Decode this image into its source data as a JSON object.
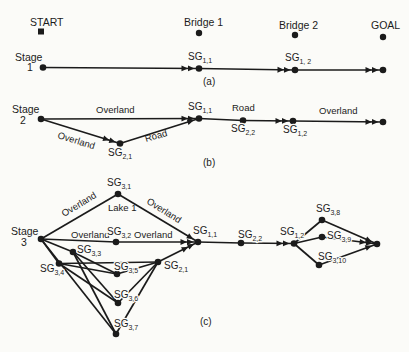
{
  "figure": {
    "width": 409,
    "height": 352,
    "bg": "#fbfbf8",
    "ink": "#1b1b1b",
    "stroke": 1.7,
    "node_r": 3.3,
    "label_size": 10,
    "sub_size": 7,
    "markers": [
      {
        "id": "start",
        "shape": "square",
        "x": 41,
        "y": 31.5,
        "size": 6
      },
      {
        "id": "bridge-1",
        "shape": "dot",
        "x": 199,
        "y": 33,
        "r": 3.2
      },
      {
        "id": "bridge-2",
        "shape": "dot",
        "x": 295,
        "y": 35,
        "r": 3.2
      },
      {
        "id": "goal",
        "shape": "dot",
        "x": 383,
        "y": 37,
        "r": 3.2
      }
    ],
    "nodes": [
      {
        "id": "a-stage1",
        "x": 43,
        "y": 67.5
      },
      {
        "id": "a-sg1-1",
        "x": 199,
        "y": 68.5
      },
      {
        "id": "a-sg1-2",
        "x": 295,
        "y": 70
      },
      {
        "id": "a-end",
        "x": 383,
        "y": 70
      },
      {
        "id": "b-stage2",
        "x": 41,
        "y": 119
      },
      {
        "id": "b-sg2-1",
        "x": 120,
        "y": 143.5
      },
      {
        "id": "b-sg1-1",
        "x": 199,
        "y": 118.5
      },
      {
        "id": "b-sg2-2",
        "x": 243,
        "y": 120.5
      },
      {
        "id": "b-sg1-2",
        "x": 293,
        "y": 121
      },
      {
        "id": "b-end",
        "x": 383,
        "y": 122
      },
      {
        "id": "c-stage3",
        "x": 41,
        "y": 239
      },
      {
        "id": "c-sg3-1",
        "x": 118,
        "y": 194
      },
      {
        "id": "c-sg3-2",
        "x": 116,
        "y": 242
      },
      {
        "id": "c-sg3-3",
        "x": 73,
        "y": 252
      },
      {
        "id": "c-sg3-4",
        "x": 59,
        "y": 263.5
      },
      {
        "id": "c-sg3-5",
        "x": 117,
        "y": 274
      },
      {
        "id": "c-sg3-6",
        "x": 118,
        "y": 303
      },
      {
        "id": "c-sg3-7",
        "x": 116,
        "y": 334
      },
      {
        "id": "c-sg2-1",
        "x": 158,
        "y": 262
      },
      {
        "id": "c-sg1-1",
        "x": 198,
        "y": 242
      },
      {
        "id": "c-sg2-2",
        "x": 241,
        "y": 243
      },
      {
        "id": "c-sg1-2",
        "x": 294,
        "y": 243.5
      },
      {
        "id": "c-sg3-8",
        "x": 322,
        "y": 220
      },
      {
        "id": "c-sg3-9",
        "x": 322,
        "y": 237
      },
      {
        "id": "c-sg3-10",
        "x": 319,
        "y": 265
      },
      {
        "id": "c-end",
        "x": 377,
        "y": 244
      }
    ],
    "edges": [
      {
        "from": "a-stage1",
        "to": "a-sg1-1",
        "arrows": 2
      },
      {
        "from": "a-sg1-1",
        "to": "a-sg1-2",
        "arrows": 2
      },
      {
        "from": "a-sg1-2",
        "to": "a-end",
        "arrows": 2
      },
      {
        "from": "b-stage2",
        "to": "b-sg1-1",
        "arrows": 2
      },
      {
        "from": "b-stage2",
        "to": "b-sg2-1",
        "arrows": 2
      },
      {
        "from": "b-sg2-1",
        "to": "b-sg1-1",
        "arrows": 1
      },
      {
        "from": "b-sg1-1",
        "to": "b-sg2-2",
        "arrows": 0
      },
      {
        "from": "b-sg2-2",
        "to": "b-sg1-2",
        "arrows": 2
      },
      {
        "from": "b-sg1-2",
        "to": "b-end",
        "arrows": 2
      },
      {
        "from": "c-stage3",
        "to": "c-sg3-1",
        "arrows": 0
      },
      {
        "from": "c-sg3-1",
        "to": "c-sg1-1",
        "arrows": 1
      },
      {
        "from": "c-stage3",
        "to": "c-sg3-2",
        "arrows": 0
      },
      {
        "from": "c-sg3-2",
        "to": "c-sg1-1",
        "arrows": 2
      },
      {
        "from": "c-stage3",
        "to": "c-sg3-3",
        "arrows": 0
      },
      {
        "from": "c-stage3",
        "to": "c-sg3-4",
        "arrows": 0
      },
      {
        "from": "c-stage3",
        "to": "c-sg3-7",
        "arrows": 0
      },
      {
        "from": "c-sg3-3",
        "to": "c-sg3-5",
        "arrows": 0
      },
      {
        "from": "c-sg3-3",
        "to": "c-sg3-6",
        "arrows": 0
      },
      {
        "from": "c-sg3-3",
        "to": "c-sg3-7",
        "arrows": 0
      },
      {
        "from": "c-sg3-4",
        "to": "c-sg3-5",
        "arrows": 0
      },
      {
        "from": "c-sg3-4",
        "to": "c-sg3-6",
        "arrows": 0
      },
      {
        "from": "c-sg3-4",
        "to": "c-sg2-1",
        "arrows": 0
      },
      {
        "from": "c-sg3-5",
        "to": "c-sg2-1",
        "arrows": 0
      },
      {
        "from": "c-sg3-6",
        "to": "c-sg2-1",
        "arrows": 0
      },
      {
        "from": "c-sg3-7",
        "to": "c-sg2-1",
        "arrows": 0
      },
      {
        "from": "c-sg2-1",
        "to": "c-sg1-1",
        "arrows": 2
      },
      {
        "from": "c-sg1-1",
        "to": "c-sg2-2",
        "arrows": 0
      },
      {
        "from": "c-sg2-2",
        "to": "c-sg1-2",
        "arrows": 2
      },
      {
        "from": "c-sg1-2",
        "to": "c-sg3-8",
        "arrows": 0
      },
      {
        "from": "c-sg1-2",
        "to": "c-sg3-9",
        "arrows": 0
      },
      {
        "from": "c-sg1-2",
        "to": "c-sg3-10",
        "arrows": 0
      },
      {
        "from": "c-sg3-8",
        "to": "c-end",
        "arrows": 1
      },
      {
        "from": "c-sg3-9",
        "to": "c-end",
        "arrows": 2
      },
      {
        "from": "c-sg3-10",
        "to": "c-end",
        "arrows": 1
      }
    ],
    "labels": [
      {
        "id": "start",
        "text": "START",
        "x": 30,
        "y": 25.5,
        "size": 10.5
      },
      {
        "id": "bridge-1",
        "text": "Bridge 1",
        "x": 184,
        "y": 26,
        "size": 10.5
      },
      {
        "id": "bridge-2",
        "text": "Bridge 2",
        "x": 279,
        "y": 29,
        "size": 10.5
      },
      {
        "id": "goal",
        "text": "GOAL",
        "x": 371,
        "y": 29,
        "size": 10.5
      },
      {
        "id": "a-stage",
        "text": "Stage",
        "x": 15,
        "y": 61,
        "size": 10.5
      },
      {
        "id": "a-stage-num",
        "text": "1",
        "x": 27,
        "y": 71,
        "size": 10.5
      },
      {
        "id": "a-sg1-1",
        "base": "SG",
        "sub": "1,1",
        "x": 188,
        "y": 60
      },
      {
        "id": "a-sg1-2",
        "base": "SG",
        "sub": "1, 2",
        "x": 285,
        "y": 61
      },
      {
        "id": "caption-a",
        "text": "(a)",
        "x": 203,
        "y": 85
      },
      {
        "id": "b-stage",
        "text": "Stage",
        "x": 12,
        "y": 113,
        "size": 10.5
      },
      {
        "id": "b-stage-num",
        "text": "2",
        "x": 20,
        "y": 124,
        "size": 10.5
      },
      {
        "id": "b-overland-top",
        "text": "Overland",
        "x": 96,
        "y": 113,
        "size": 9.5
      },
      {
        "id": "b-overland-diag",
        "text": "Overland",
        "x": 57,
        "y": 138,
        "size": 9.5,
        "rot": 17
      },
      {
        "id": "b-sg2-1",
        "base": "SG",
        "sub": "2,1",
        "x": 108,
        "y": 156
      },
      {
        "id": "b-road-diag",
        "text": "Road",
        "x": 146,
        "y": 142,
        "size": 9.5,
        "rot": -16
      },
      {
        "id": "b-sg1-1",
        "base": "SG",
        "sub": "1,1",
        "x": 188,
        "y": 110
      },
      {
        "id": "b-road-top",
        "text": "Road",
        "x": 232,
        "y": 111,
        "size": 9.5
      },
      {
        "id": "b-sg2-2",
        "base": "SG",
        "sub": "2,2",
        "x": 231,
        "y": 132
      },
      {
        "id": "b-sg1-2",
        "base": "SG",
        "sub": "1,2",
        "x": 283,
        "y": 133
      },
      {
        "id": "b-overland-right",
        "text": "Overland",
        "x": 319,
        "y": 114,
        "size": 9.5
      },
      {
        "id": "caption-b",
        "text": "(b)",
        "x": 203,
        "y": 166
      },
      {
        "id": "c-sg3-1",
        "base": "SG",
        "sub": "3,1",
        "x": 107,
        "y": 186
      },
      {
        "id": "c-lake-1",
        "text": "Lake 1",
        "x": 108,
        "y": 211,
        "size": 9.5
      },
      {
        "id": "c-overland-upleft",
        "text": "Overland",
        "x": 64,
        "y": 217,
        "size": 9.5,
        "rot": -31
      },
      {
        "id": "c-overland-upright",
        "text": "Overland",
        "x": 146,
        "y": 203,
        "size": 9.5,
        "rot": 32
      },
      {
        "id": "c-stage",
        "text": "Stage",
        "x": 11,
        "y": 235,
        "size": 10.5
      },
      {
        "id": "c-stage-num",
        "text": "3",
        "x": 21,
        "y": 246,
        "size": 10.5
      },
      {
        "id": "c-overland-h1",
        "text": "Overland",
        "x": 71,
        "y": 238,
        "size": 9.5
      },
      {
        "id": "c-sg3-2",
        "base": "SG",
        "sub": "3,2",
        "x": 107,
        "y": 235
      },
      {
        "id": "c-overland-h2",
        "text": "Overland",
        "x": 134,
        "y": 238,
        "size": 9.5
      },
      {
        "id": "c-sg1-1",
        "base": "SG",
        "sub": "1,1",
        "x": 193,
        "y": 234
      },
      {
        "id": "c-sg3-3",
        "base": "SG",
        "sub": "3,3",
        "x": 77,
        "y": 253
      },
      {
        "id": "c-sg3-4",
        "base": "SG",
        "sub": "3,4",
        "x": 40,
        "y": 272
      },
      {
        "id": "c-sg3-5",
        "base": "SG",
        "sub": "3,5",
        "x": 114,
        "y": 270
      },
      {
        "id": "c-sg2-1",
        "base": "SG",
        "sub": "2,1",
        "x": 164,
        "y": 269
      },
      {
        "id": "c-sg3-6",
        "base": "SG",
        "sub": "3,6",
        "x": 114,
        "y": 298
      },
      {
        "id": "c-sg3-7",
        "base": "SG",
        "sub": "3,7",
        "x": 114,
        "y": 327
      },
      {
        "id": "c-sg2-2",
        "base": "SG",
        "sub": "2,2",
        "x": 238,
        "y": 238
      },
      {
        "id": "c-sg1-2",
        "base": "SG",
        "sub": "1,2",
        "x": 280,
        "y": 235
      },
      {
        "id": "c-sg3-8",
        "base": "SG",
        "sub": "3,8",
        "x": 316,
        "y": 212
      },
      {
        "id": "c-sg3-9",
        "base": "SG",
        "sub": "3,9",
        "x": 327,
        "y": 239
      },
      {
        "id": "c-sg3-10",
        "base": "SG",
        "sub": "3,10",
        "x": 318,
        "y": 260
      },
      {
        "id": "caption-c",
        "text": "(c)",
        "x": 200,
        "y": 325
      }
    ]
  }
}
